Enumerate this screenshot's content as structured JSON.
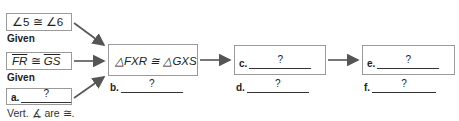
{
  "diagram": {
    "given1": {
      "statement": "∠5 ≅ ∠6",
      "reason": "Given"
    },
    "given2": {
      "seg1": "FR",
      "op": " ≅ ",
      "seg2": "GS",
      "reason": "Given"
    },
    "given3": {
      "label": "a.",
      "blank": "?",
      "reason": "Vert. ∡ are ≅."
    },
    "middle": {
      "statement": "△FXR ≅ △GXS",
      "label": "b.",
      "blank": "?"
    },
    "step_c": {
      "label": "c.",
      "blank": "?"
    },
    "step_d": {
      "label": "d.",
      "blank": "?"
    },
    "step_e": {
      "label": "e.",
      "blank": "?"
    },
    "step_f": {
      "label": "f.",
      "blank": "?"
    }
  },
  "colors": {
    "border": "#9a9a9a",
    "arrow": "#555555"
  }
}
